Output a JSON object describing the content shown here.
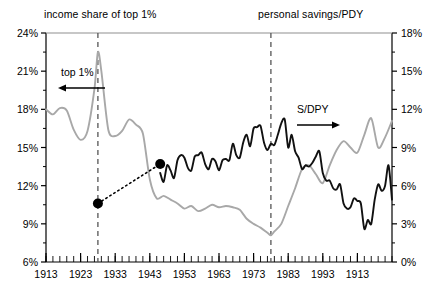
{
  "header": {
    "left_label": "income share of top 1%",
    "right_label": "personal savings/PDY"
  },
  "annotations": {
    "top1_label": "top 1%",
    "top1_arrow": "left-arrow-icon",
    "sdpy_label": "S/DPY",
    "sdpy_arrow": "right-arrow-icon"
  },
  "chart_data": {
    "type": "line",
    "title": "",
    "xlabel": "",
    "grid": false,
    "legend": "none",
    "xlim": [
      1913,
      2013
    ],
    "x_ticks": [
      "1913",
      "1923",
      "1933",
      "1943",
      "1953",
      "1963",
      "1973",
      "1983",
      "1993",
      "1913"
    ],
    "x_tick_values": [
      1913,
      1923,
      1933,
      1943,
      1953,
      1963,
      1973,
      1983,
      1993,
      2003
    ],
    "minor_tick_interval": 2,
    "axes": [
      {
        "side": "left",
        "label": "income share of top 1%",
        "ylim": [
          6,
          24
        ],
        "ticks": [
          "6%",
          "9%",
          "12%",
          "15%",
          "18%",
          "21%",
          "24%"
        ],
        "tick_values": [
          6,
          9,
          12,
          15,
          18,
          21,
          24
        ]
      },
      {
        "side": "right",
        "label": "personal savings/PDY",
        "ylim": [
          0,
          18
        ],
        "ticks": [
          "0%",
          "3%",
          "6%",
          "9%",
          "12%",
          "15%",
          "18%"
        ],
        "tick_values": [
          0,
          3,
          6,
          9,
          12,
          15,
          18
        ]
      }
    ],
    "vertical_markers": [
      {
        "name": "marker-1928",
        "x": 1928,
        "style": "dashed",
        "color": "#555555"
      },
      {
        "name": "marker-1978",
        "x": 1978,
        "style": "dashed",
        "color": "#555555"
      }
    ],
    "series": [
      {
        "name": "income share of top 1%",
        "short_name": "top 1%",
        "axis": "left",
        "color": "#a8a8a8",
        "style": "solid",
        "x": [
          1913,
          1915,
          1917,
          1919,
          1921,
          1923,
          1925,
          1927,
          1928,
          1929,
          1931,
          1933,
          1935,
          1937,
          1939,
          1941,
          1943,
          1945,
          1947,
          1949,
          1951,
          1953,
          1955,
          1957,
          1959,
          1961,
          1963,
          1965,
          1967,
          1969,
          1971,
          1973,
          1975,
          1977,
          1978,
          1979,
          1981,
          1983,
          1985,
          1987,
          1989,
          1991,
          1993,
          1995,
          1997,
          1999,
          2001,
          2003,
          2005,
          2007,
          2009,
          2011,
          2013
        ],
        "y": [
          18.0,
          17.6,
          18.1,
          17.9,
          16.4,
          15.6,
          16.3,
          19.6,
          22.5,
          21.0,
          16.4,
          15.9,
          16.3,
          17.2,
          16.8,
          16.1,
          12.5,
          11.0,
          11.2,
          10.9,
          10.6,
          10.2,
          10.4,
          10.0,
          10.2,
          10.5,
          10.3,
          10.4,
          10.3,
          10.1,
          9.4,
          9.0,
          8.7,
          8.3,
          8.1,
          8.4,
          9.0,
          10.4,
          11.8,
          13.3,
          13.6,
          12.9,
          12.2,
          13.6,
          14.8,
          15.5,
          15.0,
          14.6,
          16.0,
          17.3,
          15.0,
          15.8,
          17.1
        ]
      },
      {
        "name": "personal savings/PDY",
        "short_name": "S/DPY",
        "axis": "right",
        "color": "#111111",
        "style": "solid",
        "x": [
          1946,
          1947,
          1948,
          1949,
          1950,
          1951,
          1952,
          1953,
          1954,
          1955,
          1956,
          1957,
          1958,
          1959,
          1960,
          1961,
          1962,
          1963,
          1964,
          1965,
          1966,
          1967,
          1968,
          1969,
          1970,
          1971,
          1972,
          1973,
          1974,
          1975,
          1976,
          1977,
          1978,
          1979,
          1980,
          1981,
          1982,
          1983,
          1984,
          1985,
          1986,
          1987,
          1988,
          1989,
          1990,
          1991,
          1992,
          1993,
          1994,
          1995,
          1996,
          1997,
          1998,
          1999,
          2000,
          2001,
          2002,
          2003,
          2004,
          2005,
          2006,
          2007,
          2008,
          2009,
          2010,
          2011,
          2012,
          2013
        ],
        "y": [
          7.0,
          6.3,
          7.6,
          7.2,
          6.6,
          8.0,
          8.4,
          8.2,
          7.4,
          7.2,
          8.3,
          8.4,
          8.6,
          7.7,
          7.3,
          8.1,
          7.9,
          7.2,
          8.0,
          8.1,
          8.0,
          9.3,
          8.4,
          8.2,
          9.4,
          10.0,
          9.1,
          10.5,
          10.6,
          10.7,
          9.4,
          8.8,
          9.3,
          9.2,
          10.0,
          10.9,
          11.2,
          9.0,
          10.0,
          8.7,
          8.2,
          7.3,
          7.6,
          7.5,
          7.8,
          8.3,
          8.7,
          7.0,
          6.4,
          6.4,
          5.8,
          5.7,
          6.1,
          4.6,
          4.2,
          4.3,
          5.0,
          4.8,
          4.6,
          2.6,
          3.3,
          3.0,
          4.9,
          6.1,
          5.6,
          6.0,
          7.6,
          4.9
        ]
      },
      {
        "name": "trend-connector",
        "axis": "left",
        "color": "#000000",
        "style": "dotted",
        "x": [
          1928,
          1946
        ],
        "y": [
          10.6,
          13.7
        ],
        "markers": [
          {
            "name": "data-point-1928",
            "x": 1928,
            "y": 10.6
          },
          {
            "name": "data-point-1946",
            "x": 1946,
            "y": 13.7
          }
        ]
      }
    ]
  }
}
